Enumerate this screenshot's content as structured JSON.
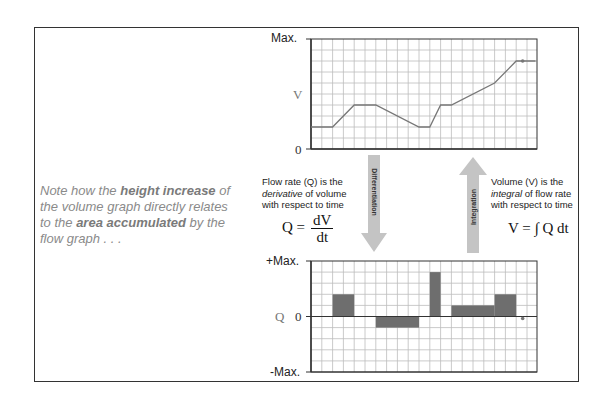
{
  "note": {
    "parts": [
      {
        "text": "Note how the ",
        "bold": false
      },
      {
        "text": "height increase",
        "bold": true
      },
      {
        "text": " of the volume graph directly relates to the ",
        "bold": false
      },
      {
        "text": "area accumulated",
        "bold": true
      },
      {
        "text": " by the flow graph . . .",
        "bold": false
      }
    ]
  },
  "volume_graph": {
    "label_max": "Max.",
    "label_var": "V",
    "label_zero": "0"
  },
  "flow_graph": {
    "label_max": "+Max.",
    "label_var": "Q",
    "label_zero": "0",
    "label_min": "-Max."
  },
  "differentiation": {
    "arrow_label": "Differentiation",
    "desc_line1": "Flow rate (Q) is the",
    "desc_italic": "derivative",
    "desc_line2_rest": " of volume",
    "desc_line3": "with respect to time",
    "formula_lhs": "Q =",
    "formula_num": "dV",
    "formula_den": "dt"
  },
  "integration": {
    "arrow_label": "Integration",
    "desc_line1": "Volume (V) is the",
    "desc_italic": "integral",
    "desc_line2_rest": " of flow rate",
    "desc_line3": "with respect to time",
    "formula": "V = ∫ Q dt"
  },
  "colors": {
    "grid": "#bdbdbd",
    "axis": "#333333",
    "line": "#777777",
    "bar": "#6e6e6e",
    "arrow": "#c4c4c4"
  },
  "chart_data": [
    {
      "type": "line",
      "title": "Volume",
      "ylabel": "V",
      "ytick_labels": [
        "0",
        "Max."
      ],
      "grid": true,
      "grid_cols": 21,
      "grid_rows": 10,
      "ylim": [
        0,
        10
      ],
      "x": [
        0,
        2,
        4,
        6,
        10,
        11,
        12,
        13,
        17,
        19,
        20.8
      ],
      "y": [
        2,
        2,
        4,
        4,
        2,
        2,
        4,
        4,
        6,
        8,
        8
      ],
      "marker": {
        "x": 19.6,
        "y": 8
      }
    },
    {
      "type": "bar",
      "title": "Flow rate",
      "ylabel": "Q",
      "ytick_labels": [
        "-Max.",
        "0",
        "+Max."
      ],
      "grid": true,
      "grid_cols": 21,
      "grid_rows": 10,
      "ylim": [
        -5,
        5
      ],
      "bars": [
        {
          "x0": 2,
          "x1": 4,
          "value": 2
        },
        {
          "x0": 6,
          "x1": 10,
          "value": -1
        },
        {
          "x0": 11,
          "x1": 12,
          "value": 4
        },
        {
          "x0": 13,
          "x1": 17,
          "value": 1
        },
        {
          "x0": 17,
          "x1": 19,
          "value": 2
        }
      ],
      "marker": {
        "x": 19.6,
        "y": 0
      }
    }
  ]
}
